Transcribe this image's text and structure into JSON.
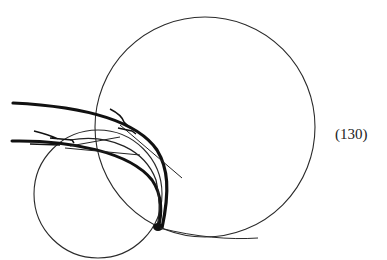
{
  "figure": {
    "equation_label": "(130)",
    "stroke_color": "#1a1a1a"
  }
}
